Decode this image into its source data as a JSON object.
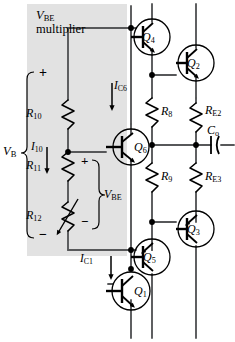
{
  "figure": {
    "kind": "circuit-schematic",
    "shaded_region_label_line1": "V",
    "shaded_region_label_line1_sub": "BE",
    "shaded_region_label_line2": "multiplier"
  },
  "labels": {
    "vbe_multiplier_v": "V",
    "vbe_multiplier_sub": "BE",
    "vbe_multiplier_word": "multiplier",
    "plus_top": "+",
    "minus_bottom": "−",
    "plus_r11": "+",
    "minus_r12": "−",
    "v_b": "V",
    "v_b_sub": "B",
    "v_be": "V",
    "v_be_sub": "BE",
    "i_10": "I",
    "i_10_sub": "10",
    "i_c6": "I",
    "i_c6_sub": "C6",
    "i_c1": "I",
    "i_c1_sub": "C1"
  },
  "components": {
    "resistors": [
      {
        "id": "R10",
        "name": "R",
        "sub": "10",
        "type": "fixed"
      },
      {
        "id": "R11",
        "name": "R",
        "sub": "11",
        "type": "fixed"
      },
      {
        "id": "R12",
        "name": "R",
        "sub": "12",
        "type": "variable"
      },
      {
        "id": "R8",
        "name": "R",
        "sub": "8",
        "type": "fixed"
      },
      {
        "id": "R9",
        "name": "R",
        "sub": "9",
        "type": "fixed"
      },
      {
        "id": "RE2",
        "name": "R",
        "sub": "E2",
        "type": "fixed"
      },
      {
        "id": "RE3",
        "name": "R",
        "sub": "E3",
        "type": "fixed"
      }
    ],
    "capacitors": [
      {
        "id": "Co",
        "name": "C",
        "sub": "o"
      }
    ],
    "transistors": [
      {
        "id": "Q1",
        "name": "Q",
        "sub": "1",
        "polarity": "npn"
      },
      {
        "id": "Q2",
        "name": "Q",
        "sub": "2",
        "polarity": "npn"
      },
      {
        "id": "Q3",
        "name": "Q",
        "sub": "3",
        "polarity": "pnp"
      },
      {
        "id": "Q4",
        "name": "Q",
        "sub": "4",
        "polarity": "npn"
      },
      {
        "id": "Q5",
        "name": "Q",
        "sub": "5",
        "polarity": "pnp"
      },
      {
        "id": "Q6",
        "name": "Q",
        "sub": "6",
        "polarity": "npn"
      }
    ]
  },
  "colors": {
    "wire": "#57585a",
    "ink": "#000000",
    "shade": "#e2e2e2",
    "background": "#ffffff"
  }
}
